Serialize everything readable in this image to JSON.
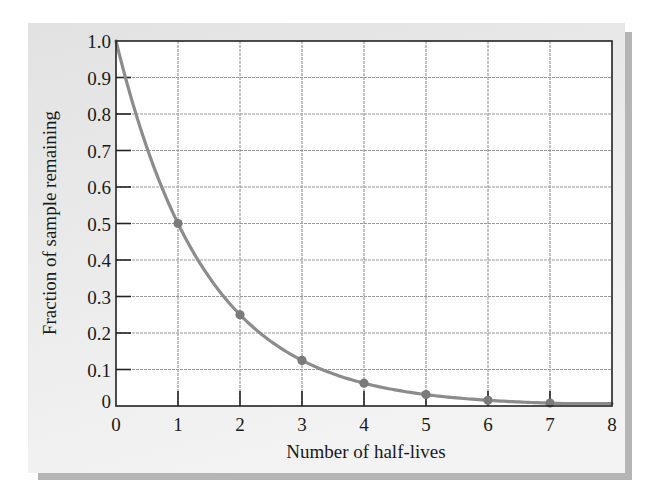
{
  "chart_data": {
    "type": "line",
    "title": "",
    "xlabel": "Number of half-lives",
    "ylabel": "Fraction of sample remaining",
    "xlim": [
      0,
      8
    ],
    "ylim": [
      0,
      1.0
    ],
    "x_ticks": [
      "0",
      "1",
      "2",
      "3",
      "4",
      "5",
      "6",
      "7",
      "8"
    ],
    "y_ticks": [
      "0",
      "0.1",
      "0.2",
      "0.3",
      "0.4",
      "0.5",
      "0.6",
      "0.7",
      "0.8",
      "0.9",
      "1.0"
    ],
    "grid": true,
    "legend": null,
    "series": [
      {
        "name": "Fraction remaining",
        "curve": "y = 0.5^x",
        "x": [
          0,
          1,
          2,
          3,
          4,
          5,
          6,
          7,
          8
        ],
        "values": [
          1.0,
          0.5,
          0.25,
          0.125,
          0.0625,
          0.03125,
          0.015625,
          0.0078125,
          0.00390625
        ],
        "markers_at": [
          1,
          2,
          3,
          4,
          5,
          6,
          7
        ]
      }
    ]
  },
  "colors": {
    "panel_background": "#e6e6e6",
    "panel_shadow": "#b8b8b8",
    "plot_background": "#ffffff",
    "axis": "#222222",
    "grid": "#9a9a9a",
    "curve": "#8c8c8c",
    "marker": "#7a7a7a"
  }
}
